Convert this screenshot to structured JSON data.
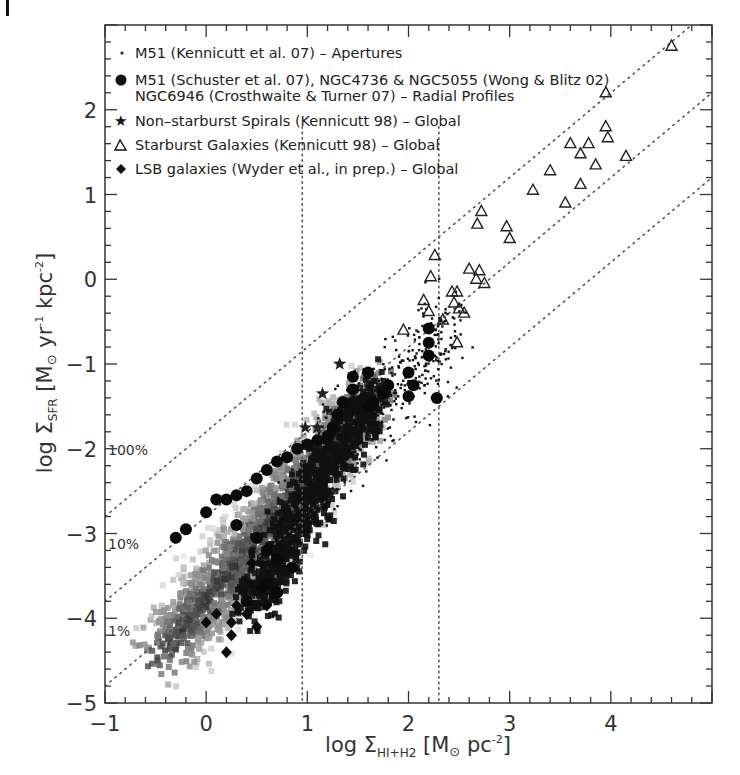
{
  "panel_marker": "l",
  "chart_data": {
    "type": "scatter",
    "title": "",
    "xlabel": "log Σ_HI+H2 [M⊙ pc⁻²]",
    "ylabel": "log Σ_SFR [M⊙ yr⁻¹ kpc⁻²]",
    "xlabel_parts": {
      "pre": "log Σ",
      "sub": "HI+H2",
      "post": " [M",
      "sun": "⊙",
      "unit": " pc",
      "sup": "-2",
      "close": "]"
    },
    "ylabel_parts": {
      "pre": "log Σ",
      "sub": "SFR",
      "post": " [M",
      "sun": "⊙",
      "unit1": " yr",
      "sup1": "-1",
      "unit2": " kpc",
      "sup2": "-2",
      "close": "]"
    },
    "xlim": [
      -1,
      5
    ],
    "ylim": [
      -5,
      3
    ],
    "x_ticks": [
      -1,
      0,
      1,
      2,
      3,
      4
    ],
    "y_ticks": [
      -5,
      -4,
      -3,
      -2,
      -1,
      0,
      1,
      2
    ],
    "grid": false,
    "legend_position": "upper-left (inside)",
    "legend": [
      {
        "marker": "dot",
        "label": "M51 (Kennicutt et al. 07) – Apertures"
      },
      {
        "marker": "filled-circle",
        "label": "M51 (Schuster et al. 07), NGC4736 & NGC5055 (Wong & Blitz 02)",
        "label2": "NGC6946 (Crosthwaite & Turner 07) – Radial Profiles"
      },
      {
        "marker": "star",
        "label": "Non–starburst Spirals (Kennicutt 98) – Global"
      },
      {
        "marker": "open-triangle",
        "label": "Starburst Galaxies (Kennicutt 98) – Global"
      },
      {
        "marker": "filled-diamond",
        "label": "LSB galaxies (Wyder et al., in prep.) – Global"
      }
    ],
    "reference_lines": [
      {
        "type": "diagonal",
        "label": "100%",
        "slope": 1,
        "intercept": -1.8
      },
      {
        "type": "diagonal",
        "label": "10%",
        "slope": 1,
        "intercept": -2.8
      },
      {
        "type": "diagonal",
        "label": "1%",
        "slope": 1,
        "intercept": -3.8
      },
      {
        "type": "vertical",
        "x": 0.95
      },
      {
        "type": "vertical",
        "x": 2.3
      }
    ],
    "annotations": [
      "100%",
      "10%",
      "1%"
    ],
    "series": [
      {
        "name": "Starburst Galaxies (Kennicutt 98) – Global",
        "marker": "open-triangle",
        "points": [
          [
            4.6,
            2.75
          ],
          [
            3.95,
            2.2
          ],
          [
            3.95,
            1.8
          ],
          [
            3.97,
            1.67
          ],
          [
            4.15,
            1.45
          ],
          [
            3.6,
            1.6
          ],
          [
            3.78,
            1.6
          ],
          [
            3.7,
            1.48
          ],
          [
            3.85,
            1.35
          ],
          [
            3.4,
            1.28
          ],
          [
            3.23,
            1.05
          ],
          [
            3.7,
            1.12
          ],
          [
            3.55,
            0.9
          ],
          [
            2.72,
            0.8
          ],
          [
            2.68,
            0.65
          ],
          [
            2.97,
            0.62
          ],
          [
            3.0,
            0.48
          ],
          [
            2.26,
            0.28
          ],
          [
            2.22,
            0.03
          ],
          [
            2.6,
            0.12
          ],
          [
            2.67,
            0.0
          ],
          [
            2.7,
            0.1
          ],
          [
            2.75,
            -0.05
          ],
          [
            2.43,
            -0.15
          ],
          [
            2.48,
            -0.15
          ],
          [
            2.45,
            -0.28
          ],
          [
            2.5,
            -0.35
          ],
          [
            2.15,
            -0.25
          ],
          [
            2.2,
            -0.38
          ],
          [
            2.55,
            -0.4
          ],
          [
            2.34,
            -0.48
          ],
          [
            2.48,
            -0.75
          ],
          [
            1.95,
            -0.6
          ]
        ]
      },
      {
        "name": "Non–starburst Spirals (Kennicutt 98) – Global",
        "marker": "star",
        "points": [
          [
            1.32,
            -1.0
          ],
          [
            1.15,
            -1.35
          ],
          [
            0.98,
            -1.75
          ],
          [
            1.1,
            -1.75
          ]
        ]
      },
      {
        "name": "M51 / NGC4736 / NGC5055 / NGC6946 – Radial Profiles",
        "marker": "filled-circle",
        "points": [
          [
            2.2,
            -0.58
          ],
          [
            2.2,
            -0.75
          ],
          [
            2.2,
            -0.9
          ],
          [
            2.28,
            -1.4
          ],
          [
            2.0,
            -1.1
          ],
          [
            2.05,
            -1.25
          ],
          [
            2.0,
            -1.38
          ],
          [
            1.8,
            -1.25
          ],
          [
            1.75,
            -1.35
          ],
          [
            1.65,
            -1.45
          ],
          [
            1.6,
            -1.5
          ],
          [
            1.6,
            -1.1
          ],
          [
            1.45,
            -1.3
          ],
          [
            1.45,
            -1.15
          ],
          [
            1.35,
            -1.45
          ],
          [
            1.3,
            -1.6
          ],
          [
            1.25,
            -1.75
          ],
          [
            1.2,
            -1.85
          ],
          [
            1.1,
            -1.9
          ],
          [
            1.0,
            -1.95
          ],
          [
            0.9,
            -2.0
          ],
          [
            0.8,
            -2.1
          ],
          [
            0.7,
            -2.15
          ],
          [
            0.6,
            -2.25
          ],
          [
            0.5,
            -2.35
          ],
          [
            0.4,
            -2.5
          ],
          [
            0.3,
            -2.55
          ],
          [
            0.2,
            -2.6
          ],
          [
            0.1,
            -2.6
          ],
          [
            0.0,
            -2.75
          ],
          [
            -0.2,
            -2.95
          ],
          [
            -0.3,
            -3.05
          ],
          [
            0.3,
            -2.9
          ],
          [
            0.5,
            -3.05
          ],
          [
            0.6,
            -3.2
          ],
          [
            0.7,
            -3.3
          ],
          [
            0.85,
            -3.4
          ],
          [
            0.6,
            -3.6
          ],
          [
            0.7,
            -3.7
          ],
          [
            0.4,
            -3.8
          ]
        ]
      },
      {
        "name": "LSB galaxies (Wyder et al., in prep.) – Global",
        "marker": "filled-diamond",
        "points": [
          [
            0.45,
            -3.35
          ],
          [
            0.55,
            -3.65
          ],
          [
            0.7,
            -3.7
          ],
          [
            0.3,
            -3.85
          ],
          [
            0.6,
            -3.85
          ],
          [
            0.1,
            -3.95
          ],
          [
            0.25,
            -4.05
          ],
          [
            0.5,
            -4.1
          ],
          [
            0.0,
            -4.05
          ],
          [
            0.25,
            -4.2
          ],
          [
            0.2,
            -4.4
          ],
          [
            0.4,
            -3.95
          ]
        ]
      },
      {
        "name": "M51 (Kennicutt et al. 07) – Apertures",
        "marker": "dot",
        "points": "dense cloud, approx. x 0.9–2.5, y -2.8 to -0.4 along slope ~1.4"
      },
      {
        "name": "Pixel-by-pixel density (gray shading)",
        "marker": "grayscale-density",
        "points": "dense distribution, x -0.4 to 1.8, y -4.6 to -1.2"
      }
    ]
  }
}
